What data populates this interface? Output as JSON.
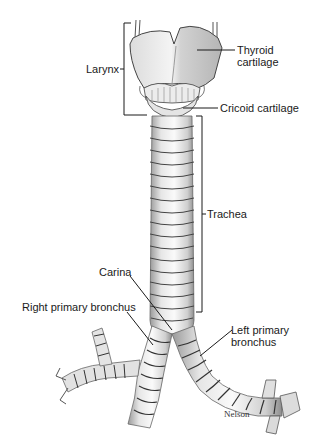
{
  "diagram": {
    "type": "anatomical-illustration",
    "labels": {
      "larynx": "Larynx",
      "thyroid_line1": "Thyroid",
      "thyroid_line2": "cartilage",
      "cricoid": "Cricoid cartilage",
      "trachea": "Trachea",
      "carina": "Carina",
      "right_bronchus": "Right primary bronchus",
      "left_bronchus_line1": "Left primary",
      "left_bronchus_line2": "bronchus"
    },
    "signature": "Nelson",
    "colors": {
      "background": "#ffffff",
      "ink": "#1a1a1a",
      "cartilage_light": "#f2f2f2",
      "cartilage_shade": "#b8b8b8",
      "ring_line": "#555555"
    }
  }
}
